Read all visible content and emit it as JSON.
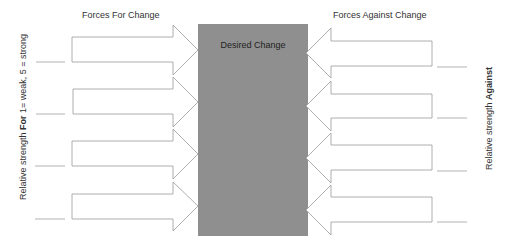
{
  "diagram": {
    "type": "force-field-analysis",
    "left_title": "Forces For Change",
    "right_title": "Forces Against Change",
    "center_label": "Desired Change",
    "left_axis_label_prefix": "Relative strength ",
    "left_axis_label_bold": "For",
    "left_axis_label_suffix": " 1= weak, 5 = strong",
    "right_axis_label_prefix": "Relative strength ",
    "right_axis_label_bold": "Against",
    "left_arrow_count": 4,
    "right_arrow_count": 4,
    "colors": {
      "box": "#8f8f8f",
      "arrow_stroke": "#999999",
      "line": "#999999"
    }
  }
}
